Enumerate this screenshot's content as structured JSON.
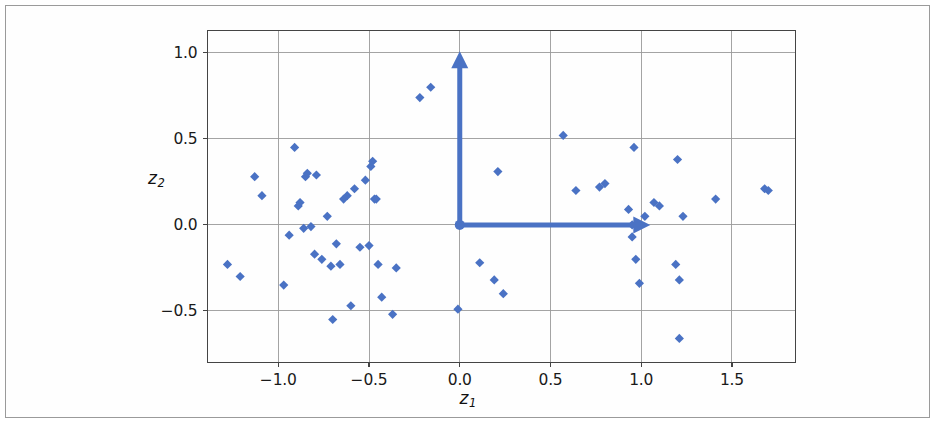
{
  "figure": {
    "background_color": "#ffffff",
    "frame_color": "#9a9a9a",
    "marker_color": "#4a72c4",
    "arrow_color": "#4a72c4",
    "grid_color": "#9a9a9a",
    "spine_color": "#444444"
  },
  "chart_data": {
    "type": "scatter",
    "title": "",
    "xlabel": "z_1",
    "ylabel": "z_2",
    "xlabel_text": "z",
    "xlabel_sub": "1",
    "ylabel_text": "z",
    "ylabel_sub": "2",
    "xlim": [
      -1.39,
      1.85
    ],
    "ylim": [
      -0.8,
      1.13
    ],
    "xticks": [
      -1.0,
      -0.5,
      0.0,
      0.5,
      1.0,
      1.5
    ],
    "xticklabels": [
      "−1.0",
      "−0.5",
      "0.0",
      "0.5",
      "1.0",
      "1.5"
    ],
    "yticks": [
      -0.5,
      0.0,
      0.5,
      1.0
    ],
    "yticklabels": [
      "−0.5",
      "0.0",
      "0.5",
      "1.0"
    ],
    "grid": true,
    "legend": null,
    "marker": "diamond",
    "x": [
      -1.28,
      -1.21,
      -1.13,
      -1.09,
      -0.97,
      -0.94,
      -0.91,
      -0.89,
      -0.88,
      -0.86,
      -0.85,
      -0.84,
      -0.82,
      -0.8,
      -0.79,
      -0.76,
      -0.73,
      -0.71,
      -0.7,
      -0.68,
      -0.66,
      -0.64,
      -0.62,
      -0.6,
      -0.58,
      -0.55,
      -0.52,
      -0.5,
      -0.49,
      -0.48,
      -0.47,
      -0.46,
      -0.45,
      -0.43,
      -0.37,
      -0.35,
      -0.22,
      -0.16,
      -0.01,
      0.11,
      0.19,
      0.21,
      0.24,
      0.57,
      0.64,
      0.77,
      0.8,
      0.93,
      0.95,
      0.95,
      0.96,
      0.97,
      0.99,
      1.02,
      1.07,
      1.1,
      1.19,
      1.2,
      1.21,
      1.21,
      1.23,
      1.41,
      1.68,
      1.7
    ],
    "y": [
      -0.23,
      -0.3,
      0.28,
      0.17,
      -0.35,
      -0.06,
      0.45,
      0.11,
      0.13,
      -0.02,
      0.28,
      0.3,
      -0.01,
      -0.17,
      0.29,
      -0.2,
      0.05,
      -0.24,
      -0.55,
      -0.11,
      -0.23,
      0.15,
      0.17,
      -0.47,
      0.21,
      -0.13,
      0.26,
      -0.12,
      0.34,
      0.37,
      0.15,
      0.15,
      -0.23,
      -0.42,
      -0.52,
      -0.25,
      0.74,
      0.8,
      -0.49,
      -0.22,
      -0.32,
      0.31,
      -0.4,
      0.52,
      0.2,
      0.22,
      0.24,
      0.09,
      0.0,
      -0.07,
      0.45,
      -0.2,
      -0.34,
      0.05,
      0.13,
      0.11,
      -0.23,
      0.38,
      -0.32,
      -0.66,
      0.05,
      0.15,
      0.21,
      0.2
    ],
    "annotations": [
      {
        "name": "principal-axis-arrow-z1",
        "type": "arrow",
        "from": [
          0.0,
          0.0
        ],
        "to": [
          1.05,
          0.0
        ],
        "color": "#4a72c4"
      },
      {
        "name": "principal-axis-arrow-z2",
        "type": "arrow",
        "from": [
          0.0,
          0.0
        ],
        "to": [
          0.0,
          1.01
        ],
        "color": "#4a72c4"
      },
      {
        "name": "origin-marker",
        "type": "point",
        "at": [
          0.0,
          0.0
        ],
        "color": "#4a72c4"
      }
    ]
  }
}
